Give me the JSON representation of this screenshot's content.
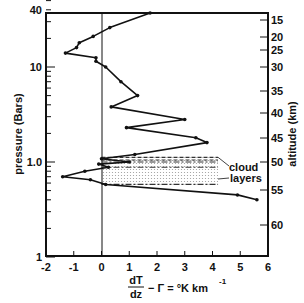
{
  "chart_data": {
    "type": "line",
    "title": "",
    "xlabel": "dT/dz − Γ = °K km⁻¹",
    "ylabel": "pressure (Bars)",
    "y2label": "altitude (km)",
    "xlim": [
      -2,
      6
    ],
    "ylim": [
      0.1,
      50
    ],
    "yscale": "log",
    "x_ticks": [
      "-2",
      "-1",
      "0",
      "1",
      "2",
      "3",
      "4",
      "5",
      "6"
    ],
    "y_ticks": [
      {
        "label": "40",
        "value": 40
      },
      {
        "label": "10",
        "value": 10
      },
      {
        "label": "1.0",
        "value": 1.0
      },
      {
        "label": "1",
        "value": 0.1
      }
    ],
    "y2_ticks": [
      "15",
      "20",
      "25",
      "30",
      "35",
      "40",
      "45",
      "50",
      "55",
      "60"
    ],
    "series": [
      {
        "name": "lapse rate profile",
        "points": [
          {
            "x": 1.75,
            "p": 37
          },
          {
            "x": 0.3,
            "p": 26
          },
          {
            "x": -0.3,
            "p": 21
          },
          {
            "x": -0.8,
            "p": 18
          },
          {
            "x": -0.9,
            "p": 16
          },
          {
            "x": -1.3,
            "p": 14
          },
          {
            "x": -0.2,
            "p": 12.5
          },
          {
            "x": -0.2,
            "p": 11.5
          },
          {
            "x": 0.15,
            "p": 10
          },
          {
            "x": 0.7,
            "p": 7
          },
          {
            "x": 1.3,
            "p": 5
          },
          {
            "x": 0.35,
            "p": 3.8
          },
          {
            "x": 3.0,
            "p": 2.8
          },
          {
            "x": 0.9,
            "p": 2.3
          },
          {
            "x": 3.4,
            "p": 1.8
          },
          {
            "x": 3.8,
            "p": 1.6
          },
          {
            "x": 1.2,
            "p": 1.2
          },
          {
            "x": 0.0,
            "p": 1.08
          },
          {
            "x": 1.0,
            "p": 1.0
          },
          {
            "x": -0.1,
            "p": 0.95
          },
          {
            "x": 0.25,
            "p": 0.88
          },
          {
            "x": -0.6,
            "p": 0.8
          },
          {
            "x": -1.4,
            "p": 0.7
          },
          {
            "x": -0.4,
            "p": 0.65
          },
          {
            "x": 0.15,
            "p": 0.58
          },
          {
            "x": 4.9,
            "p": 0.45
          },
          {
            "x": 5.6,
            "p": 0.4
          }
        ]
      }
    ],
    "annotations": [
      {
        "text": "cloud",
        "x": 4.6,
        "p": 0.98
      },
      {
        "text": "layers",
        "x": 4.6,
        "p": 0.82
      }
    ],
    "cloud_layers": [
      {
        "p_top": 1.12,
        "p_bottom": 1.02,
        "style": "dashed"
      },
      {
        "p_top": 1.02,
        "p_bottom": 0.88,
        "style": "dash-dot"
      },
      {
        "p_top": 0.88,
        "p_bottom": 0.58,
        "style": "dash-dot"
      }
    ],
    "grid": false,
    "legend": "none"
  },
  "labels": {
    "cloud": "cloud",
    "layers": "layers",
    "ylabel": "pressure (Bars)",
    "y2label": "altitude (km)",
    "xlabel_num": "dT",
    "xlabel_den": "dz",
    "xlabel_rest": "− Γ = °K km",
    "xlabel_sup": "-1"
  }
}
